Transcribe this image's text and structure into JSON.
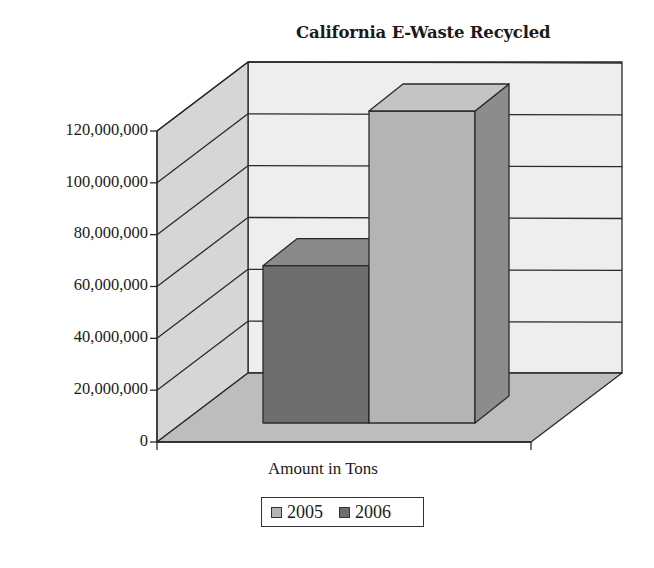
{
  "chart_data": {
    "type": "bar",
    "subtype": "3d-clustered-column",
    "title": "California E-Waste Recycled",
    "xlabel": "Amount in Tons",
    "ylabel": "",
    "categories": [
      "Amount in Tons"
    ],
    "series": [
      {
        "name": "2005",
        "values": [
          121000000
        ],
        "color": "#b4b4b4"
      },
      {
        "name": "2006",
        "values": [
          61000000
        ],
        "color": "#6e6e6e"
      }
    ],
    "ylim": [
      0,
      120000000
    ],
    "yticks": [
      "0",
      "20,000,000",
      "40,000,000",
      "60,000,000",
      "80,000,000",
      "100,000,000",
      "120,000,000"
    ],
    "grid": true,
    "legend_position": "bottom"
  },
  "legend": {
    "items": [
      {
        "label": "2005",
        "color": "#b4b4b4"
      },
      {
        "label": "2006",
        "color": "#6e6e6e"
      }
    ]
  },
  "colors": {
    "back_wall": "#eeeeee",
    "side_wall": "#d6d6d6",
    "floor": "#bdbdbd",
    "edge": "#2a2a2a"
  }
}
